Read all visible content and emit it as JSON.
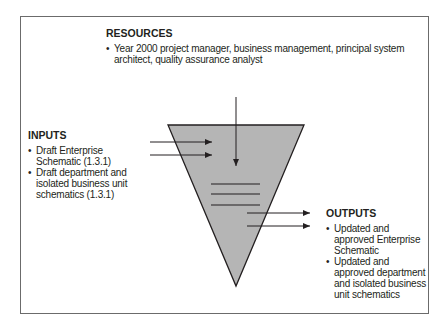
{
  "resources": {
    "title": "RESOURCES",
    "items": [
      "Year 2000 project manager, business management, principal system architect, quality assurance analyst"
    ]
  },
  "inputs": {
    "title": "INPUTS",
    "items": [
      "Draft Enterprise Schematic (1.3.1)",
      "Draft department and isolated business unit schematics (1.3.1)"
    ]
  },
  "outputs": {
    "title": "OUTPUTS",
    "items": [
      "Updated and approved Enterprise Schematic",
      "Updated and approved department and isolated business unit schematics"
    ]
  },
  "colors": {
    "funnel_fill": "#b5b5b5",
    "stroke": "#231f20",
    "frame": "#6b6b6b"
  }
}
